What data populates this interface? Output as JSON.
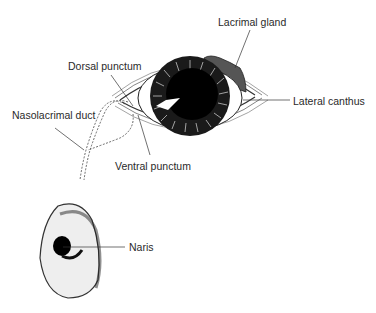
{
  "labels": {
    "lacrimal_gland": "Lacrimal gland",
    "dorsal_punctum": "Dorsal punctum",
    "lateral_canthus": "Lateral canthus",
    "nasolacrimal_duct": "Nasolacrimal duct",
    "ventral_punctum": "Ventral punctum",
    "naris": "Naris"
  },
  "caption": "FIGURE — Nasolacrimal system (caption cut off)"
}
